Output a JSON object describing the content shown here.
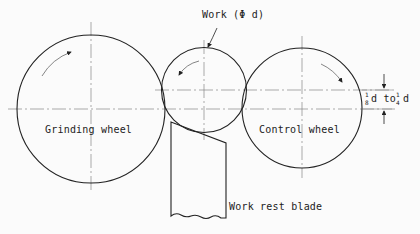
{
  "diagram": {
    "labels": {
      "work": "Work (Φ d)",
      "grinding_wheel": "Grinding wheel",
      "control_wheel": "Control wheel",
      "work_rest_blade": "Work rest blade",
      "offset_prefix_num": "1",
      "offset_prefix_den": "8",
      "offset_mid": "d to ",
      "offset_suffix_num": "1",
      "offset_suffix_den": "4",
      "offset_end": "d"
    },
    "components": [
      {
        "name": "Grinding wheel",
        "rotation": "clockwise"
      },
      {
        "name": "Work",
        "rotation": "counterclockwise"
      },
      {
        "name": "Control wheel",
        "rotation": "clockwise"
      },
      {
        "name": "Work rest blade"
      }
    ],
    "colors": {
      "line": "#222222",
      "centerline": "#888888",
      "background": "#fbfbfb"
    }
  }
}
